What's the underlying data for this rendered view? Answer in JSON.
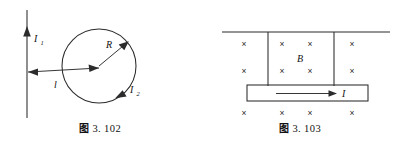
{
  "page": {
    "background_color": "#ffffff",
    "ink_color": "#2b2b2b",
    "width": 400,
    "height": 149
  },
  "figures": [
    {
      "id": "fig-3-102",
      "caption_prefix": "图",
      "caption_number": "3. 102",
      "caption_full": "图 3. 102",
      "description": "Straight current-carrying wire beside a circular loop",
      "labels": {
        "wire_current": "I",
        "wire_current_sub": "1",
        "wire_current_full": "I₁",
        "distance": "l",
        "radius": "R",
        "loop_current": "I",
        "loop_current_sub": "2",
        "loop_current_full": "I₂"
      },
      "geometry": {
        "wire_x": 27,
        "wire_y_top": 10,
        "wire_y_bottom": 118,
        "wire_arrow_y": 33,
        "circle_cx": 99,
        "circle_cy": 66,
        "circle_r": 37,
        "distance_line_y": 72,
        "radius_angle_deg": -40
      }
    },
    {
      "id": "fig-3-103",
      "caption_prefix": "图",
      "caption_number": "3. 103",
      "caption_full": "图 3. 103",
      "description": "Conducting bar carrying current I in a magnetic field directed into the page",
      "labels": {
        "field": "B",
        "current": "I"
      },
      "field_direction": "into-page",
      "field_symbol": "×",
      "field_rows": [
        {
          "row": 1,
          "y": 44,
          "xs": [
            244,
            282,
            310,
            352
          ]
        },
        {
          "row": 2,
          "y": 70,
          "xs": [
            244,
            282,
            310,
            352
          ]
        },
        {
          "row": 3,
          "y": 115,
          "xs": [
            244,
            282,
            310,
            352
          ]
        }
      ],
      "geometry": {
        "top_line_x1": 222,
        "top_line_x2": 390,
        "top_line_y": 32,
        "rail_left_x": 268,
        "rail_right_x": 334,
        "rail_y_top": 32,
        "rail_y_bottom": 86,
        "bar_x": 247,
        "bar_y": 85,
        "bar_w": 121,
        "bar_h": 16,
        "current_arrow_x1": 276,
        "current_arrow_x2": 336,
        "current_arrow_y": 93
      }
    }
  ]
}
